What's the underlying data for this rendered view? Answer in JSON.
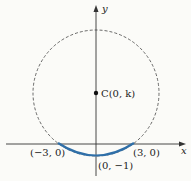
{
  "diagram": {
    "axes": {
      "x_label": "x",
      "y_label": "y"
    },
    "circle": {
      "style": "dashed",
      "center_label": "C(0, k)"
    },
    "arc": {
      "color": "#2f6fa8"
    },
    "points": [
      {
        "label": "(−3, 0)"
      },
      {
        "label": "(3, 0)"
      },
      {
        "label": "(0, −1)"
      }
    ]
  }
}
